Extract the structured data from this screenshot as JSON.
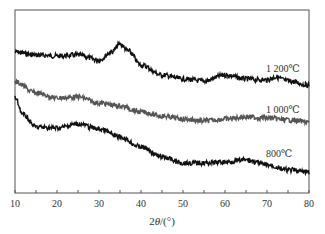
{
  "chart_data": {
    "type": "line",
    "title": "",
    "xlabel": "2θ/(°)",
    "ylabel": "",
    "xlim": [
      10,
      80
    ],
    "ylim": [
      0,
      183
    ],
    "grid": false,
    "legend_position": "inline-right",
    "x_ticks": [
      10,
      20,
      30,
      40,
      50,
      60,
      70,
      80
    ],
    "x_tick_labels": [
      "10",
      "20",
      "30",
      "40",
      "50",
      "60",
      "70",
      "80"
    ],
    "annotations": [
      "1 200℃",
      "1 000℃",
      "800℃"
    ],
    "series": [
      {
        "name": "1 200℃",
        "color": "#111111",
        "x": [
          10,
          15,
          20,
          25,
          30,
          33,
          35,
          37,
          40,
          45,
          50,
          55,
          60,
          65,
          70,
          72,
          75,
          80
        ],
        "values": [
          141,
          138,
          137,
          138,
          133,
          141,
          149,
          142,
          128,
          118,
          114,
          112,
          118,
          114,
          113,
          116,
          112,
          108
        ]
      },
      {
        "name": "1 000℃",
        "color": "#555555",
        "x": [
          10,
          15,
          20,
          25,
          30,
          35,
          40,
          45,
          50,
          55,
          60,
          65,
          70,
          75,
          80
        ],
        "values": [
          111,
          100,
          95,
          96,
          90,
          87,
          81,
          77,
          74,
          72,
          74,
          76,
          75,
          73,
          71
        ]
      },
      {
        "name": "800℃",
        "color": "#111111",
        "x": [
          10,
          12,
          15,
          20,
          25,
          30,
          35,
          40,
          45,
          50,
          55,
          60,
          65,
          70,
          75,
          80
        ],
        "values": [
          95,
          78,
          66,
          65,
          69,
          64,
          56,
          46,
          36,
          30,
          30,
          31,
          33,
          28,
          23,
          21
        ]
      }
    ]
  },
  "labels": {
    "xlabel_prefix": "2",
    "xlabel_theta": "θ",
    "xlabel_unit": "/(°)",
    "series_1200": "1 200℃",
    "series_1000": "1 000℃",
    "series_800": "800℃"
  }
}
